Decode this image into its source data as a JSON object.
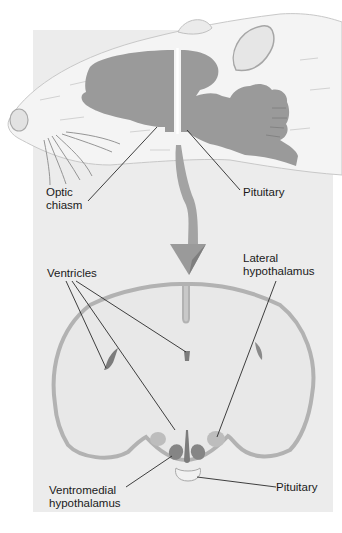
{
  "figure": {
    "colors": {
      "background": "#ffffff",
      "panel": "#ececec",
      "brain_tissue": "#9a9a9a",
      "ventricle": "#7c7c7c",
      "cortex_outline": "#b2b2b2",
      "lateral_hypothalamus": "#bdbdbd",
      "ventromedial_hypothalamus": "#858585",
      "leader_line": "#2a2a2a"
    }
  },
  "top_view": {
    "name": "sagittal-rat-head",
    "labels": {
      "optic_chiasm": "Optic\nchiasm",
      "pituitary": "Pituitary"
    }
  },
  "arrow": {
    "direction": "down",
    "meaning": "coronal section taken at cut line"
  },
  "bottom_view": {
    "name": "coronal-brain-section",
    "labels": {
      "ventricles": "Ventricles",
      "lateral_hypothalamus": "Lateral\nhypothalamus",
      "ventromedial_hypothalamus": "Ventromedial\nhypothalamus",
      "pituitary": "Pituitary"
    }
  }
}
